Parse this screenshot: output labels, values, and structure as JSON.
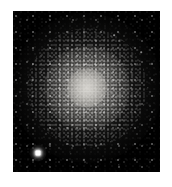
{
  "figure": {
    "kind": "astronomical-image",
    "caption_top": "",
    "caption_bottom": "",
    "background_color": "#ffffff",
    "sky_color": "#000000",
    "star_color": "#ffffff",
    "core_color": "#d8d6d1",
    "panel": {
      "left": 13,
      "top": 11,
      "width": 147,
      "height": 161
    }
  },
  "cluster": {
    "label": "globular-cluster",
    "center_x": 74,
    "center_y": 77,
    "core_radius": 20,
    "halo_radius": 43,
    "corona_radius": 75
  },
  "bright_star": {
    "label": "foreground-star",
    "x": 25,
    "y": 142
  },
  "bleed_row": {
    "y": 80
  },
  "field_stars": [
    {
      "x": 12,
      "y": 18,
      "r": 0.6,
      "a": 0.35
    },
    {
      "x": 29,
      "y": 11,
      "r": 0.5,
      "a": 0.28
    },
    {
      "x": 46,
      "y": 22,
      "r": 0.7,
      "a": 0.45
    },
    {
      "x": 63,
      "y": 9,
      "r": 0.5,
      "a": 0.3
    },
    {
      "x": 84,
      "y": 16,
      "r": 0.6,
      "a": 0.38
    },
    {
      "x": 101,
      "y": 24,
      "r": 0.8,
      "a": 0.52
    },
    {
      "x": 118,
      "y": 13,
      "r": 0.5,
      "a": 0.26
    },
    {
      "x": 133,
      "y": 27,
      "r": 0.6,
      "a": 0.34
    },
    {
      "x": 141,
      "y": 8,
      "r": 0.5,
      "a": 0.24
    },
    {
      "x": 8,
      "y": 39,
      "r": 0.6,
      "a": 0.31
    },
    {
      "x": 24,
      "y": 48,
      "r": 0.7,
      "a": 0.4
    },
    {
      "x": 38,
      "y": 34,
      "r": 0.5,
      "a": 0.27
    },
    {
      "x": 55,
      "y": 43,
      "r": 0.6,
      "a": 0.36
    },
    {
      "x": 96,
      "y": 38,
      "r": 0.7,
      "a": 0.44
    },
    {
      "x": 112,
      "y": 47,
      "r": 0.6,
      "a": 0.33
    },
    {
      "x": 128,
      "y": 41,
      "r": 0.8,
      "a": 0.5
    },
    {
      "x": 139,
      "y": 52,
      "r": 0.5,
      "a": 0.25
    },
    {
      "x": 6,
      "y": 62,
      "r": 0.6,
      "a": 0.3
    },
    {
      "x": 19,
      "y": 73,
      "r": 0.7,
      "a": 0.42
    },
    {
      "x": 33,
      "y": 66,
      "r": 0.5,
      "a": 0.26
    },
    {
      "x": 120,
      "y": 68,
      "r": 0.6,
      "a": 0.35
    },
    {
      "x": 135,
      "y": 77,
      "r": 0.7,
      "a": 0.41
    },
    {
      "x": 143,
      "y": 63,
      "r": 0.5,
      "a": 0.24
    },
    {
      "x": 10,
      "y": 91,
      "r": 0.6,
      "a": 0.32
    },
    {
      "x": 26,
      "y": 101,
      "r": 0.7,
      "a": 0.39
    },
    {
      "x": 40,
      "y": 94,
      "r": 0.5,
      "a": 0.25
    },
    {
      "x": 124,
      "y": 97,
      "r": 0.6,
      "a": 0.36
    },
    {
      "x": 138,
      "y": 108,
      "r": 0.7,
      "a": 0.43
    },
    {
      "x": 15,
      "y": 117,
      "r": 0.6,
      "a": 0.33
    },
    {
      "x": 31,
      "y": 126,
      "r": 0.5,
      "a": 0.27
    },
    {
      "x": 48,
      "y": 115,
      "r": 0.7,
      "a": 0.41
    },
    {
      "x": 64,
      "y": 128,
      "r": 0.6,
      "a": 0.34
    },
    {
      "x": 81,
      "y": 119,
      "r": 0.5,
      "a": 0.26
    },
    {
      "x": 98,
      "y": 131,
      "r": 0.7,
      "a": 0.4
    },
    {
      "x": 114,
      "y": 122,
      "r": 0.6,
      "a": 0.32
    },
    {
      "x": 130,
      "y": 134,
      "r": 0.5,
      "a": 0.25
    },
    {
      "x": 9,
      "y": 140,
      "r": 0.6,
      "a": 0.3
    },
    {
      "x": 43,
      "y": 151,
      "r": 0.5,
      "a": 0.23
    },
    {
      "x": 58,
      "y": 143,
      "r": 0.7,
      "a": 0.38
    },
    {
      "x": 74,
      "y": 152,
      "r": 0.6,
      "a": 0.31
    },
    {
      "x": 90,
      "y": 145,
      "r": 0.5,
      "a": 0.24
    },
    {
      "x": 106,
      "y": 154,
      "r": 0.7,
      "a": 0.37
    },
    {
      "x": 122,
      "y": 147,
      "r": 0.6,
      "a": 0.29
    },
    {
      "x": 136,
      "y": 156,
      "r": 0.5,
      "a": 0.22
    },
    {
      "x": 52,
      "y": 57,
      "r": 0.5,
      "a": 0.3
    },
    {
      "x": 93,
      "y": 60,
      "r": 0.5,
      "a": 0.28
    },
    {
      "x": 69,
      "y": 31,
      "r": 0.6,
      "a": 0.33
    },
    {
      "x": 78,
      "y": 136,
      "r": 0.5,
      "a": 0.22
    }
  ]
}
